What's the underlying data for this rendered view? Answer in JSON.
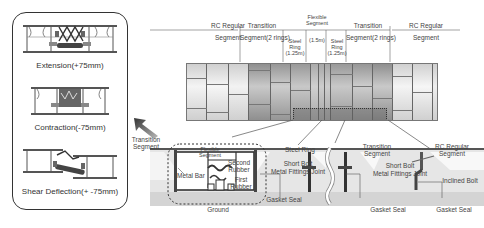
{
  "left_panel": {
    "modes": [
      {
        "label": "Extension(+75mm)"
      },
      {
        "label": "Contraction(-75mm)"
      },
      {
        "label": "Shear Deflection(+ -75mm)"
      }
    ]
  },
  "top_labels": {
    "rc_regular_left": [
      "RC Regular",
      "Segment"
    ],
    "transition_left": [
      "Transition",
      "Segment(2 rings)"
    ],
    "steel_ring_left": [
      "Steel",
      "Ring",
      "(1.25m)"
    ],
    "flexible": [
      "Flexible",
      "Segment",
      "(1.5m)"
    ],
    "steel_ring_right": [
      "Steel",
      "Ring",
      "(1.25m)"
    ],
    "transition_right": [
      "Transition",
      "Segment(2 rings)"
    ],
    "rc_regular_right": [
      "RC Regular",
      "Segment"
    ]
  },
  "detail_labels": {
    "transition_segment_left": [
      "Transition",
      "Segment"
    ],
    "flexible_segment": [
      "Flexible",
      "Segment"
    ],
    "second_rubber": [
      "Second",
      "Rubber"
    ],
    "first_rubber": [
      "First",
      "Rubber"
    ],
    "metal_bar": "Metal Bar",
    "ground": "Ground",
    "steel_ring": "Steel Ring",
    "short_bolt_1": "Short Bolt",
    "metal_fittings_joint_1": "Metal Fittings Joint",
    "gasket_seal_1": "Gasket Seal",
    "transition_segment_right": [
      "Transition",
      "Segment"
    ],
    "rc_regular_segment": [
      "RC Regular",
      "Segment"
    ],
    "short_bolt_2": "Short Bolt",
    "metal_fittings_joint_2": "Metal Fittings Joint",
    "inclined_bolt": "Inclined Bolt",
    "gasket_seal_2": "Gasket Seal",
    "gasket_seal_3": "Gasket Seal"
  },
  "colors": {
    "rc_segment": "#dcdcdc",
    "transition_segment": "#a9a9a9",
    "steel_ring": "#b5b5b5",
    "flexible": "#c4c4c4",
    "ground": "#d0d0d0",
    "outline": "#333333"
  }
}
